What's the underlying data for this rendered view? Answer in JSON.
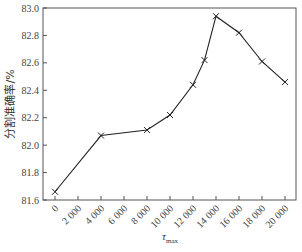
{
  "chart_data": {
    "type": "line",
    "title": "",
    "xlabel": "τ_max",
    "xlabel_main": "τ",
    "xlabel_sub": "max",
    "ylabel": "分割准确率/%",
    "ylim": [
      81.6,
      83.0
    ],
    "xlim": [
      0,
      20000
    ],
    "yticks": [
      81.6,
      81.8,
      82.0,
      82.2,
      82.4,
      82.6,
      82.8,
      83.0
    ],
    "ytick_labels": [
      "81.6",
      "81.8",
      "82.0",
      "82.2",
      "82.4",
      "82.6",
      "82.8",
      "83.0"
    ],
    "xticks": [
      0,
      2000,
      4000,
      6000,
      8000,
      10000,
      12000,
      14000,
      16000,
      18000,
      20000
    ],
    "xtick_labels": [
      "0",
      "2 000",
      "4 000",
      "6 000",
      "8 000",
      "10 000",
      "12 000",
      "14 000",
      "16 000",
      "18 000",
      "20 000"
    ],
    "grid": false,
    "legend": null,
    "marker": "x",
    "line_color": "#222222",
    "series": [
      {
        "name": "分割准确率",
        "x": [
          0,
          4000,
          8000,
          10000,
          12000,
          13000,
          14000,
          16000,
          18000,
          20000
        ],
        "values": [
          81.66,
          82.07,
          82.11,
          82.22,
          82.44,
          82.62,
          82.94,
          82.82,
          82.61,
          82.46
        ]
      }
    ]
  }
}
